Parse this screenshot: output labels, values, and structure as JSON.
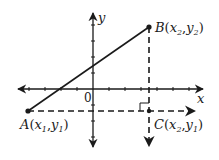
{
  "diagram": {
    "type": "coordinate-plane-distance",
    "colors": {
      "ink": "#1a1a1a",
      "background": "#ffffff"
    },
    "axes": {
      "x_label": "x",
      "y_label": "y",
      "origin_label": "0",
      "origin_px": [
        93,
        89
      ],
      "tick_spacing_px": 16
    },
    "points": [
      {
        "id": "A",
        "name": "A",
        "coord_text": "x1,y1",
        "x_sub": "1",
        "y_sub": "1",
        "px": [
          28,
          111
        ]
      },
      {
        "id": "B",
        "name": "B",
        "coord_text": "x2,y2",
        "x_sub": "2",
        "y_sub": "2",
        "px": [
          149,
          27
        ]
      },
      {
        "id": "C",
        "name": "C",
        "coord_text": "x2,y1",
        "x_sub": "2",
        "y_sub": "1",
        "px": [
          149,
          111
        ]
      }
    ],
    "segments": [
      {
        "from": "A",
        "to": "B",
        "style": "solid"
      },
      {
        "from": "A",
        "to": "C",
        "style": "dashed",
        "arrow": "right"
      },
      {
        "from": "B",
        "to": "C",
        "style": "dashed",
        "arrow": "down"
      }
    ],
    "right_angle_at": "C"
  },
  "labels": {
    "x_axis": "x",
    "y_axis": "y",
    "origin": "0",
    "A_name": "A",
    "A_x": "x",
    "A_xsub": "1",
    "A_y": "y",
    "A_ysub": "1",
    "B_name": "B",
    "B_x": "x",
    "B_xsub": "2",
    "B_y": "y",
    "B_ysub": "2",
    "C_name": "C",
    "C_x": "x",
    "C_xsub": "2",
    "C_y": "y",
    "C_ysub": "1"
  }
}
